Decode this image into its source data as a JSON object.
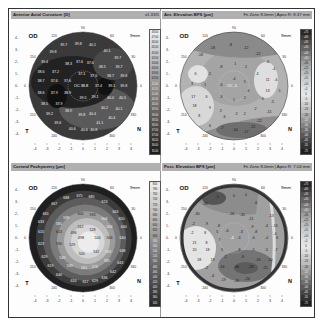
{
  "panels": [
    {
      "title": "Anterior Axial Curvature [D]",
      "right_info": "x1.33/5",
      "eye": "OD",
      "zone": "9mm",
      "type": "axial",
      "center_label": "OC",
      "center_value": "38.8",
      "values": [
        {
          "x": -1.6,
          "y": 3.4,
          "v": "39.7"
        },
        {
          "x": -0.4,
          "y": 3.5,
          "v": "39.8"
        },
        {
          "x": 0.8,
          "y": 3.4,
          "v": "40.1"
        },
        {
          "x": -2.5,
          "y": 2.8,
          "v": "39.8"
        },
        {
          "x": 2.0,
          "y": 2.9,
          "v": "40.1"
        },
        {
          "x": 2.9,
          "y": 2.3,
          "v": "39.7"
        },
        {
          "x": -3.2,
          "y": 2.0,
          "v": "39.4"
        },
        {
          "x": -1.2,
          "y": 1.8,
          "v": "38.3"
        },
        {
          "x": -0.3,
          "y": 2.0,
          "v": "37.6"
        },
        {
          "x": 0.6,
          "y": 1.9,
          "v": "37.6"
        },
        {
          "x": 1.6,
          "y": 1.6,
          "v": "38.5"
        },
        {
          "x": 3.0,
          "y": 1.6,
          "v": "39.7"
        },
        {
          "x": -3.5,
          "y": 1.2,
          "v": "38.6"
        },
        {
          "x": -2.3,
          "y": 1.2,
          "v": "37.2"
        },
        {
          "x": -0.1,
          "y": 1.0,
          "v": "37.1"
        },
        {
          "x": 0.9,
          "y": 0.8,
          "v": "37.6"
        },
        {
          "x": 2.3,
          "y": 0.8,
          "v": "38.7"
        },
        {
          "x": 3.4,
          "y": 0.8,
          "v": "39.8"
        },
        {
          "x": -3.5,
          "y": 0.4,
          "v": "38.7"
        },
        {
          "x": -2.4,
          "y": 0.4,
          "v": "37.6"
        },
        {
          "x": -1.3,
          "y": 0.4,
          "v": "37.6"
        },
        {
          "x": 1.3,
          "y": 0,
          "v": "37.4"
        },
        {
          "x": 2.4,
          "y": 0,
          "v": "39.1"
        },
        {
          "x": 3.4,
          "y": 0,
          "v": "39.8"
        },
        {
          "x": -3.5,
          "y": -0.6,
          "v": "38.6"
        },
        {
          "x": -2.4,
          "y": -0.6,
          "v": "37.9"
        },
        {
          "x": -1.3,
          "y": -0.6,
          "v": "38.9"
        },
        {
          "x": 0,
          "y": -1.0,
          "v": "39.5"
        },
        {
          "x": 1.0,
          "y": -0.9,
          "v": "39.1"
        },
        {
          "x": 2.3,
          "y": -1.0,
          "v": "40.0"
        },
        {
          "x": 3.3,
          "y": -1.0,
          "v": "40.5"
        },
        {
          "x": -3.2,
          "y": -1.5,
          "v": "38.5"
        },
        {
          "x": -2.0,
          "y": -1.5,
          "v": "37.9"
        },
        {
          "x": 1.8,
          "y": -1.8,
          "v": "40.2"
        },
        {
          "x": 3.0,
          "y": -1.9,
          "v": "40.1"
        },
        {
          "x": -2.8,
          "y": -2.3,
          "v": "39.2"
        },
        {
          "x": -1.2,
          "y": -2.1,
          "v": "38.9"
        },
        {
          "x": -0.1,
          "y": -2.4,
          "v": "39.8"
        },
        {
          "x": 0.8,
          "y": -2.3,
          "v": "40.4"
        },
        {
          "x": 2.4,
          "y": -2.7,
          "v": "40.4"
        },
        {
          "x": -2.1,
          "y": -3.1,
          "v": "39.6"
        },
        {
          "x": 1.4,
          "y": -3.1,
          "v": "41.1"
        },
        {
          "x": -0.9,
          "y": -3.6,
          "v": "40.6"
        },
        {
          "x": 0.1,
          "y": -3.7,
          "v": "40.6"
        },
        {
          "x": 0.9,
          "y": -3.7,
          "v": "40.8"
        }
      ],
      "scale": [
        "48.00",
        "47.00",
        "46.00",
        "45.50",
        "45.00",
        "44.50",
        "44.00",
        "43.50",
        "43.00",
        "42.50",
        "42.00",
        "41.50",
        "41.00",
        "40.50",
        "40.00",
        "39.50",
        "39.00",
        "38.50",
        "38.00",
        "37.50",
        "37.00",
        "36.50",
        "36.00",
        "35.00"
      ]
    },
    {
      "title": "Ant. Elevation BFS [µm]",
      "right_info": "Fit Zone 8.0mm | Apex R: 8.37 mm",
      "eye": "OD",
      "zone": "9mm",
      "type": "elevation-anterior",
      "center_label": "OC",
      "center_value": "-5",
      "values": [
        {
          "x": -1.8,
          "y": 3.2,
          "v": "-18"
        },
        {
          "x": -0.3,
          "y": 3.4,
          "v": "-8"
        },
        {
          "x": 1.0,
          "y": 3.2,
          "v": "-12"
        },
        {
          "x": 2.0,
          "y": 2.7,
          "v": "-12"
        },
        {
          "x": -2.8,
          "y": 2.6,
          "v": "-18"
        },
        {
          "x": 2.8,
          "y": 2.0,
          "v": "-6"
        },
        {
          "x": -1.1,
          "y": 1.6,
          "v": "-8"
        },
        {
          "x": 0.1,
          "y": 1.8,
          "v": "1"
        },
        {
          "x": 1.0,
          "y": 1.6,
          "v": "2"
        },
        {
          "x": 1.9,
          "y": 1.0,
          "v": "-4"
        },
        {
          "x": 3.3,
          "y": 1.4,
          "v": "-4"
        },
        {
          "x": -3.2,
          "y": 1.0,
          "v": "6"
        },
        {
          "x": -2.0,
          "y": 1.0,
          "v": "2"
        },
        {
          "x": 0,
          "y": 0.6,
          "v": "-4"
        },
        {
          "x": 0.9,
          "y": 0.3,
          "v": "5"
        },
        {
          "x": 2.8,
          "y": 0.5,
          "v": "11"
        },
        {
          "x": 3.5,
          "y": 0.5,
          "v": "-6"
        },
        {
          "x": -3.5,
          "y": 0.2,
          "v": "3"
        },
        {
          "x": -2.4,
          "y": 0.1,
          "v": "1"
        },
        {
          "x": -1.1,
          "y": 0.1,
          "v": "-6"
        },
        {
          "x": 1.2,
          "y": -0.4,
          "v": "4"
        },
        {
          "x": 2.8,
          "y": -0.4,
          "v": "13"
        },
        {
          "x": 3.8,
          "y": -0.4,
          "v": "5"
        },
        {
          "x": -3.4,
          "y": -0.9,
          "v": "17"
        },
        {
          "x": -2.3,
          "y": -0.9,
          "v": "6"
        },
        {
          "x": -1.1,
          "y": -0.9,
          "v": "-3"
        },
        {
          "x": 0,
          "y": -1.2,
          "v": "1"
        },
        {
          "x": 0.9,
          "y": -1.0,
          "v": "2"
        },
        {
          "x": 2.4,
          "y": -1.1,
          "v": "6"
        },
        {
          "x": 3.2,
          "y": -1.3,
          "v": "-5"
        },
        {
          "x": -3.3,
          "y": -1.7,
          "v": "18"
        },
        {
          "x": -2.0,
          "y": -1.8,
          "v": "9"
        },
        {
          "x": -1.1,
          "y": -2.1,
          "v": "2"
        },
        {
          "x": 0.2,
          "y": -2.3,
          "v": "2"
        },
        {
          "x": 0.9,
          "y": -2.3,
          "v": "2"
        },
        {
          "x": 1.8,
          "y": -1.9,
          "v": "2"
        },
        {
          "x": 2.9,
          "y": -2.2,
          "v": "-15"
        },
        {
          "x": -2.9,
          "y": -2.5,
          "v": "8"
        },
        {
          "x": -0.8,
          "y": -2.6,
          "v": "6"
        },
        {
          "x": 2.1,
          "y": -2.9,
          "v": "-22"
        },
        {
          "x": -2.0,
          "y": -3.3,
          "v": "6"
        },
        {
          "x": -1.0,
          "y": -3.5,
          "v": "-7"
        },
        {
          "x": 0.1,
          "y": -3.7,
          "v": "-16"
        },
        {
          "x": 1.0,
          "y": -3.8,
          "v": "-17"
        },
        {
          "x": 1.6,
          "y": -3.4,
          "v": "22"
        }
      ],
      "scale": [
        "+75",
        "+65",
        "+55",
        "+45",
        "+40",
        "+35",
        "+30",
        "+25",
        "+20",
        "+15",
        "+10",
        "+5",
        "0",
        "-5",
        "-10",
        "-15",
        "-20",
        "-25",
        "-30",
        "-35",
        "-40",
        "-45",
        "-55",
        "-75"
      ]
    },
    {
      "title": "Corneal Pachymetry [µm]",
      "right_info": "",
      "eye": "OD",
      "zone": "9mm",
      "type": "pachymetry",
      "center_label": "",
      "center_value": "498",
      "values": [
        {
          "x": -1.4,
          "y": 3.3,
          "v": "688"
        },
        {
          "x": -0.3,
          "y": 3.5,
          "v": "675"
        },
        {
          "x": 0.7,
          "y": 3.4,
          "v": "685"
        },
        {
          "x": 1.8,
          "y": 3.0,
          "v": "674"
        },
        {
          "x": -2.4,
          "y": 2.8,
          "v": "667"
        },
        {
          "x": 2.7,
          "y": 2.2,
          "v": "663"
        },
        {
          "x": -3.1,
          "y": 2.0,
          "v": "661"
        },
        {
          "x": -1.4,
          "y": 1.7,
          "v": "598"
        },
        {
          "x": -0.2,
          "y": 2.0,
          "v": "600"
        },
        {
          "x": 0.8,
          "y": 1.9,
          "v": "594"
        },
        {
          "x": 1.8,
          "y": 1.6,
          "v": "604"
        },
        {
          "x": 3.2,
          "y": 1.6,
          "v": "650"
        },
        {
          "x": -3.5,
          "y": 1.3,
          "v": "633"
        },
        {
          "x": -2.0,
          "y": 1.2,
          "v": "581"
        },
        {
          "x": -0.2,
          "y": 0.9,
          "v": "512"
        },
        {
          "x": 0.8,
          "y": 0.7,
          "v": "528"
        },
        {
          "x": 2.2,
          "y": 0.9,
          "v": "584"
        },
        {
          "x": 3.4,
          "y": 0.9,
          "v": "640"
        },
        {
          "x": -3.5,
          "y": 0.5,
          "v": "615"
        },
        {
          "x": -2.0,
          "y": 0.5,
          "v": "613"
        },
        {
          "x": -0.8,
          "y": 0.4,
          "v": "496"
        },
        {
          "x": 1.2,
          "y": 0,
          "v": "504"
        },
        {
          "x": 2.2,
          "y": 0,
          "v": "566"
        },
        {
          "x": 3.3,
          "y": 0,
          "v": "640"
        },
        {
          "x": -3.5,
          "y": -0.5,
          "v": "623"
        },
        {
          "x": -2.0,
          "y": -0.5,
          "v": "590"
        },
        {
          "x": -0.9,
          "y": -0.6,
          "v": "529"
        },
        {
          "x": 1.1,
          "y": -1.2,
          "v": "532"
        },
        {
          "x": 2.1,
          "y": -1.2,
          "v": "569"
        },
        {
          "x": 3.3,
          "y": -1.1,
          "v": "648"
        },
        {
          "x": -3.2,
          "y": -1.6,
          "v": "629"
        },
        {
          "x": -1.7,
          "y": -1.7,
          "v": "549"
        },
        {
          "x": -0.1,
          "y": -1.3,
          "v": "505"
        },
        {
          "x": 2.0,
          "y": -1.9,
          "v": "581"
        },
        {
          "x": 3.1,
          "y": -2.1,
          "v": "643"
        },
        {
          "x": -2.7,
          "y": -2.3,
          "v": "619"
        },
        {
          "x": -1.1,
          "y": -2.3,
          "v": "539"
        },
        {
          "x": 0.1,
          "y": -2.5,
          "v": "561"
        },
        {
          "x": 1.0,
          "y": -2.4,
          "v": "576"
        },
        {
          "x": 2.5,
          "y": -2.8,
          "v": "642"
        },
        {
          "x": -2.0,
          "y": -3.1,
          "v": "646"
        },
        {
          "x": 1.8,
          "y": -3.3,
          "v": "636"
        },
        {
          "x": -0.8,
          "y": -3.6,
          "v": "610"
        },
        {
          "x": 0.2,
          "y": -3.7,
          "v": "617"
        },
        {
          "x": 1.0,
          "y": -3.6,
          "v": "629"
        }
      ],
      "scale": [
        "800",
        "780",
        "760",
        "740",
        "720",
        "700",
        "680",
        "660",
        "640",
        "620",
        "600",
        "580",
        "560",
        "540",
        "520",
        "500",
        "480",
        "460",
        "440",
        "420",
        "400",
        "380",
        "360",
        "340"
      ]
    },
    {
      "title": "Post. Elevation BFS [µm]",
      "right_info": "Fit Zone 8.0mm | Apex R: 7.04 mm",
      "eye": "OD",
      "zone": "9mm",
      "type": "elevation-posterior",
      "center_label": "",
      "center_value": "-4",
      "values": [
        {
          "x": -1.4,
          "y": 3.4,
          "v": "-5"
        },
        {
          "x": 0,
          "y": 3.5,
          "v": "0"
        },
        {
          "x": 1.0,
          "y": 3.6,
          "v": "0"
        },
        {
          "x": -2.4,
          "y": 2.8,
          "v": "-39"
        },
        {
          "x": 1.8,
          "y": 2.9,
          "v": "-6"
        },
        {
          "x": -3.1,
          "y": 2.0,
          "v": "-30"
        },
        {
          "x": -0.2,
          "y": 2.0,
          "v": "-26"
        },
        {
          "x": 0.7,
          "y": 1.9,
          "v": "-31"
        },
        {
          "x": 1.4,
          "y": 1.6,
          "v": "-21"
        },
        {
          "x": 3.1,
          "y": 1.8,
          "v": "-13"
        },
        {
          "x": -3.4,
          "y": 1.2,
          "v": "-2"
        },
        {
          "x": -2.3,
          "y": 1.2,
          "v": "-9"
        },
        {
          "x": -1.3,
          "y": 1.0,
          "v": "-8"
        },
        {
          "x": 1.5,
          "y": 0.9,
          "v": "-9"
        },
        {
          "x": 2.7,
          "y": 1.0,
          "v": "-4"
        },
        {
          "x": 3.4,
          "y": 1.0,
          "v": "-13"
        },
        {
          "x": -3.5,
          "y": 0.4,
          "v": "-2"
        },
        {
          "x": -2.4,
          "y": 0.4,
          "v": "8"
        },
        {
          "x": -1.4,
          "y": 0.5,
          "v": "5"
        },
        {
          "x": -0.6,
          "y": 0.6,
          "v": "-6"
        },
        {
          "x": 0.6,
          "y": 0.5,
          "v": "-3"
        },
        {
          "x": 1.8,
          "y": 0.5,
          "v": "-8"
        },
        {
          "x": 3.4,
          "y": 0.3,
          "v": "-4"
        },
        {
          "x": -3.3,
          "y": -0.4,
          "v": "21"
        },
        {
          "x": -2.3,
          "y": -0.4,
          "v": "8"
        },
        {
          "x": -1.2,
          "y": -0.2,
          "v": "7"
        },
        {
          "x": 0.4,
          "y": 0,
          "v": "-3"
        },
        {
          "x": 1.6,
          "y": 0,
          "v": "-6"
        },
        {
          "x": 2.7,
          "y": 0,
          "v": "-4"
        },
        {
          "x": 3.6,
          "y": 0,
          "v": "6"
        },
        {
          "x": -3.3,
          "y": -1.0,
          "v": "20"
        },
        {
          "x": -2.2,
          "y": -1.0,
          "v": "18"
        },
        {
          "x": -1.0,
          "y": -1.0,
          "v": "5"
        },
        {
          "x": 0.4,
          "y": -1.0,
          "v": "-8"
        },
        {
          "x": 1.6,
          "y": -1.0,
          "v": "-5"
        },
        {
          "x": 2.7,
          "y": -1.0,
          "v": "-5"
        },
        {
          "x": 3.5,
          "y": -1.0,
          "v": "-7"
        },
        {
          "x": -2.9,
          "y": -1.8,
          "v": "28"
        },
        {
          "x": -1.8,
          "y": -1.8,
          "v": "19"
        },
        {
          "x": -0.7,
          "y": -1.6,
          "v": "2"
        },
        {
          "x": 0.7,
          "y": -1.6,
          "v": "-8"
        },
        {
          "x": 2.0,
          "y": -1.8,
          "v": "-16"
        },
        {
          "x": 3.0,
          "y": -1.8,
          "v": "-10"
        },
        {
          "x": -2.3,
          "y": -2.5,
          "v": "-2"
        },
        {
          "x": -1.0,
          "y": -2.4,
          "v": "-16"
        },
        {
          "x": 0.2,
          "y": -2.4,
          "v": "-46"
        },
        {
          "x": 1.4,
          "y": -2.4,
          "v": "-26"
        },
        {
          "x": 2.6,
          "y": -2.5,
          "v": "-21"
        },
        {
          "x": -1.8,
          "y": -3.2,
          "v": "-4"
        },
        {
          "x": -0.9,
          "y": -3.5,
          "v": "-19"
        },
        {
          "x": 0.2,
          "y": -3.6,
          "v": "-18"
        },
        {
          "x": 1.1,
          "y": -3.4,
          "v": "-24"
        }
      ],
      "scale": [
        "+75",
        "+65",
        "+55",
        "+45",
        "+40",
        "+35",
        "+30",
        "+25",
        "+20",
        "+15",
        "+10",
        "+5",
        "0",
        "-5",
        "-10",
        "-15",
        "-20",
        "-25",
        "-30",
        "-35",
        "-40",
        "-45",
        "-55",
        "-75"
      ]
    }
  ],
  "axis": {
    "x_ticks": [
      "-4",
      "-3",
      "-2",
      "-1",
      "0",
      "1",
      "2",
      "3",
      "4"
    ],
    "y_ticks": [
      "4",
      "3",
      "2",
      "1",
      "0",
      "-1",
      "-2",
      "-3",
      "-4"
    ],
    "angle_labels": {
      "top": "90",
      "top_left": "120",
      "top_right": "60",
      "left_upper": "150",
      "right_upper": "30",
      "left": "0",
      "right": "0",
      "left_lower": "210",
      "right_lower": "330",
      "bottom_left": "240",
      "bottom_right": "300"
    },
    "temporal_label": "T",
    "nasal_label": "N"
  },
  "colors": {
    "header_bg": "#b0b0b0",
    "frame_border": "#333333"
  }
}
